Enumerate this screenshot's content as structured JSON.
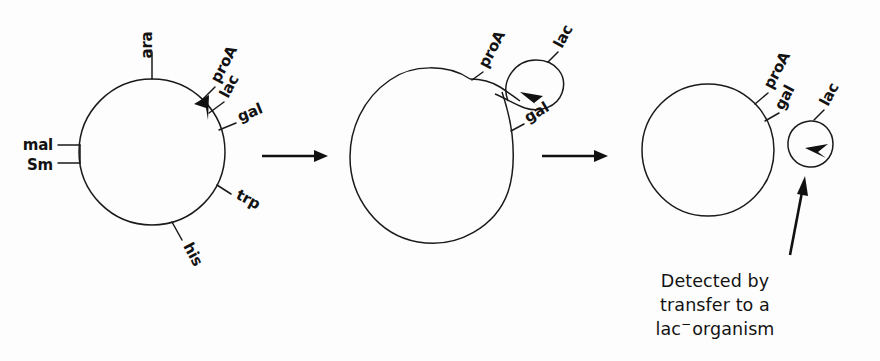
{
  "figure": {
    "background_color": "#fdfdfd",
    "ink_color": "#1a1a1a"
  },
  "panels": [
    {
      "id": "panel-1",
      "name": "intact-chromosome",
      "shape": "circle",
      "genes": [
        {
          "label": "ara",
          "angle_deg": 90,
          "rotated": true
        },
        {
          "label": "proA",
          "angle_deg": 50,
          "rotated": true
        },
        {
          "label": "lac",
          "angle_deg": 38,
          "rotated": true
        },
        {
          "label": "gal",
          "angle_deg": 24,
          "rotated": true
        },
        {
          "label": "trp",
          "angle_deg": -28,
          "rotated": true
        },
        {
          "label": "his",
          "angle_deg": -72,
          "rotated": true
        },
        {
          "label": "Sm",
          "angle_deg": 188,
          "rotated": false
        },
        {
          "label": "mal",
          "angle_deg": 172,
          "rotated": false
        }
      ],
      "has_crossover_arrow": true
    },
    {
      "id": "panel-2",
      "name": "looped-out-chromosome",
      "shape": "blob-with-loop",
      "genes": [
        {
          "label": "proA",
          "rotated": true
        },
        {
          "label": "lac",
          "rotated": true
        },
        {
          "label": "gal",
          "rotated": true
        }
      ],
      "has_crossover_arrow": true
    },
    {
      "id": "panel-3",
      "name": "chromosome-with-excised-episome",
      "shape": "circle-plus-small-circle",
      "genes": [
        {
          "label": "proA",
          "rotated": true
        },
        {
          "label": "gal",
          "rotated": true
        },
        {
          "label": "lac",
          "rotated": true,
          "on_episome": true
        }
      ],
      "has_crossover_arrow": true
    }
  ],
  "flow_arrows": [
    {
      "name": "arrow-stage-1-to-2"
    },
    {
      "name": "arrow-stage-2-to-3"
    }
  ],
  "caption": {
    "name": "detection-caption",
    "line1": "Detected  by",
    "line2": "transfer to a",
    "line3_prefix": "lac",
    "line3_superscript": "−",
    "line3_suffix": "organism",
    "pointer_arrow": "caption-pointer-arrow"
  }
}
